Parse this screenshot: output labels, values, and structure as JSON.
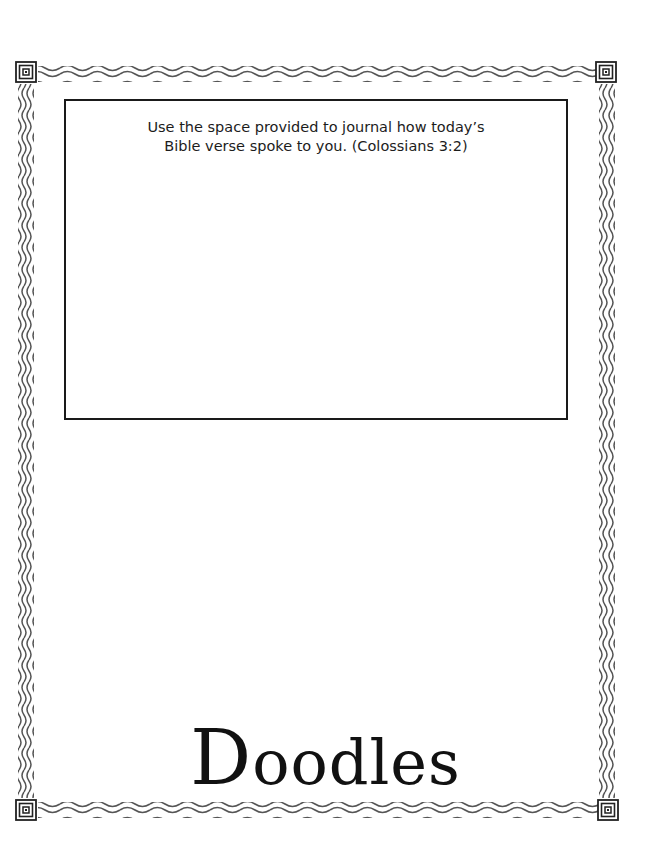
{
  "journal": {
    "prompt_line1": "Use the space provided to journal how today’s",
    "prompt_line2": "Bible verse spoke to you.   (Colossians 3:2)",
    "verse_reference": "Colossians 3:2"
  },
  "doodles": {
    "title_initial": "D",
    "title_rest": "oodles"
  },
  "decorations": {
    "border_style": "wavy-lines",
    "corner_icon": "square-spiral-icon",
    "line_color": "#555555",
    "box_border_color": "#1a1a1a"
  }
}
